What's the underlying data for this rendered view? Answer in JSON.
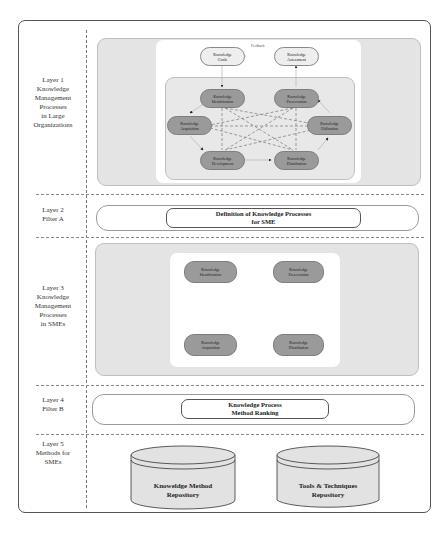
{
  "layers": [
    {
      "label": "Layer 1\nKnowledge\nManagement\nProcesses\nin Large\nOrganizations"
    },
    {
      "label": "Layer 2\nFilter A"
    },
    {
      "label": "Layer 3\nKnowledge\nManagement\nProcesses\nin SMEs"
    },
    {
      "label": "Layer 4\nFilter B"
    },
    {
      "label": "Layer 5\nMethods for\nSMEs"
    }
  ],
  "layer1": {
    "feedback_label": "Feedback",
    "goals": "Knowledge\nGoals",
    "assessment": "Knowledge\nAssessment",
    "identification": "Knowledge\nIdentification",
    "preservation": "Knowledge\nPreservation",
    "acquisition": "Knowledge\nAcquisition",
    "utilization": "Knowledge\nUtilization",
    "development": "Knowledge\nDevelopment",
    "distribution": "Knowledge\nDistribution"
  },
  "layer2": {
    "box": "Definition of Knowledge Processes\nfor SME"
  },
  "layer3": {
    "identification": "Knowledge\nIdentification",
    "preservation": "Knowledge\nPreservation",
    "acquisition": "Knowledge\nAcquisition",
    "distribution": "Knowledge\nDistribution"
  },
  "layer4": {
    "box": "Knowledge Process\nMethod Ranking"
  },
  "layer5": {
    "repo1": "Knoweldge Method\nRepository",
    "repo2": "Tools & Techniques\nRepository"
  },
  "colors": {
    "node_dark": "#9a9a9a",
    "node_light": "#eeeeee",
    "panel_gray": "#e4e4e4"
  }
}
